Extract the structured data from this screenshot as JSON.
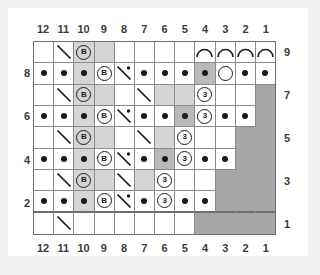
{
  "chart": {
    "type": "knitting-stitch-chart",
    "title": "",
    "columns_count": 12,
    "rows_count": 9,
    "column_labels_top": [
      "12",
      "11",
      "10",
      "9",
      "8",
      "7",
      "6",
      "5",
      "4",
      "3",
      "2",
      "1"
    ],
    "column_labels_bottom": [
      "12",
      "11",
      "10",
      "9",
      "8",
      "7",
      "6",
      "5",
      "4",
      "3",
      "2",
      "1"
    ],
    "row_labels_left": [
      "",
      "8",
      "",
      "6",
      "",
      "4",
      "",
      "2",
      ""
    ],
    "row_labels_right": [
      "9",
      "",
      "7",
      "",
      "5",
      "",
      "3",
      "",
      "1"
    ],
    "row_numbers_top_to_bottom": [
      9,
      8,
      7,
      6,
      5,
      4,
      3,
      2,
      1
    ],
    "colors": {
      "page_background": "#f1f1f1",
      "card_background": "#ffffff",
      "grid_line": "#8a8a8a",
      "grid_border": "#6e6e6e",
      "shade_light": "#d5d5d5",
      "shade_mid": "#b9b9b9",
      "shade_nostitch": "#a6a6a6",
      "symbol_ink": "#1a1a1a",
      "label_text": "#3b3b3b"
    },
    "symbol_legend": {
      "dot": "purl-stitch",
      "b": "bobble",
      "three": "three-stitch-cluster",
      "circle": "yarn-over",
      "arc": "chain-arc",
      "diag": "decrease-diagonal",
      "diagdot": "decrease-diagonal-with-purl"
    },
    "rows": [
      {
        "row": 9,
        "label_right": "9",
        "label_left": "",
        "cells": [
          {
            "col": 12,
            "shade": "none",
            "symbol": "none"
          },
          {
            "col": 11,
            "shade": "none",
            "symbol": "diag"
          },
          {
            "col": 10,
            "shade": "light",
            "symbol": "b"
          },
          {
            "col": 9,
            "shade": "light",
            "symbol": "none"
          },
          {
            "col": 8,
            "shade": "none",
            "symbol": "none"
          },
          {
            "col": 7,
            "shade": "none",
            "symbol": "none"
          },
          {
            "col": 6,
            "shade": "none",
            "symbol": "none"
          },
          {
            "col": 5,
            "shade": "none",
            "symbol": "none"
          },
          {
            "col": 4,
            "shade": "none",
            "symbol": "arc"
          },
          {
            "col": 3,
            "shade": "none",
            "symbol": "arc"
          },
          {
            "col": 2,
            "shade": "none",
            "symbol": "arc"
          },
          {
            "col": 1,
            "shade": "none",
            "symbol": "arc"
          }
        ]
      },
      {
        "row": 8,
        "label_right": "",
        "label_left": "8",
        "cells": [
          {
            "col": 12,
            "shade": "none",
            "symbol": "dot"
          },
          {
            "col": 11,
            "shade": "none",
            "symbol": "dot"
          },
          {
            "col": 10,
            "shade": "light",
            "symbol": "dot"
          },
          {
            "col": 9,
            "shade": "none",
            "symbol": "b"
          },
          {
            "col": 8,
            "shade": "none",
            "symbol": "diagdot"
          },
          {
            "col": 7,
            "shade": "none",
            "symbol": "dot"
          },
          {
            "col": 6,
            "shade": "none",
            "symbol": "dot"
          },
          {
            "col": 5,
            "shade": "none",
            "symbol": "dot"
          },
          {
            "col": 4,
            "shade": "mid",
            "symbol": "dot"
          },
          {
            "col": 3,
            "shade": "none",
            "symbol": "circle"
          },
          {
            "col": 2,
            "shade": "none",
            "symbol": "dot"
          },
          {
            "col": 1,
            "shade": "none",
            "symbol": "dot"
          }
        ]
      },
      {
        "row": 7,
        "label_right": "7",
        "label_left": "",
        "cells": [
          {
            "col": 12,
            "shade": "none",
            "symbol": "none"
          },
          {
            "col": 11,
            "shade": "none",
            "symbol": "diag"
          },
          {
            "col": 10,
            "shade": "light",
            "symbol": "b"
          },
          {
            "col": 9,
            "shade": "light",
            "symbol": "none"
          },
          {
            "col": 8,
            "shade": "none",
            "symbol": "none"
          },
          {
            "col": 7,
            "shade": "none",
            "symbol": "diag"
          },
          {
            "col": 6,
            "shade": "light",
            "symbol": "none"
          },
          {
            "col": 5,
            "shade": "light",
            "symbol": "none"
          },
          {
            "col": 4,
            "shade": "none",
            "symbol": "three"
          },
          {
            "col": 3,
            "shade": "none",
            "symbol": "none"
          },
          {
            "col": 2,
            "shade": "none",
            "symbol": "none"
          },
          {
            "col": 1,
            "shade": "block",
            "symbol": "none"
          }
        ]
      },
      {
        "row": 6,
        "label_right": "",
        "label_left": "6",
        "cells": [
          {
            "col": 12,
            "shade": "none",
            "symbol": "dot"
          },
          {
            "col": 11,
            "shade": "none",
            "symbol": "dot"
          },
          {
            "col": 10,
            "shade": "light",
            "symbol": "dot"
          },
          {
            "col": 9,
            "shade": "none",
            "symbol": "b"
          },
          {
            "col": 8,
            "shade": "none",
            "symbol": "diagdot"
          },
          {
            "col": 7,
            "shade": "none",
            "symbol": "dot"
          },
          {
            "col": 6,
            "shade": "none",
            "symbol": "dot"
          },
          {
            "col": 5,
            "shade": "mid",
            "symbol": "dot"
          },
          {
            "col": 4,
            "shade": "none",
            "symbol": "three"
          },
          {
            "col": 3,
            "shade": "none",
            "symbol": "dot"
          },
          {
            "col": 2,
            "shade": "none",
            "symbol": "dot"
          },
          {
            "col": 1,
            "shade": "block",
            "symbol": "none"
          }
        ]
      },
      {
        "row": 5,
        "label_right": "5",
        "label_left": "",
        "cells": [
          {
            "col": 12,
            "shade": "none",
            "symbol": "none"
          },
          {
            "col": 11,
            "shade": "none",
            "symbol": "diag"
          },
          {
            "col": 10,
            "shade": "light",
            "symbol": "b"
          },
          {
            "col": 9,
            "shade": "light",
            "symbol": "none"
          },
          {
            "col": 8,
            "shade": "none",
            "symbol": "none"
          },
          {
            "col": 7,
            "shade": "none",
            "symbol": "diag"
          },
          {
            "col": 6,
            "shade": "light",
            "symbol": "none"
          },
          {
            "col": 5,
            "shade": "none",
            "symbol": "three"
          },
          {
            "col": 4,
            "shade": "none",
            "symbol": "none"
          },
          {
            "col": 3,
            "shade": "none",
            "symbol": "none"
          },
          {
            "col": 2,
            "shade": "block",
            "symbol": "none"
          },
          {
            "col": 1,
            "shade": "block",
            "symbol": "none"
          }
        ]
      },
      {
        "row": 4,
        "label_right": "",
        "label_left": "4",
        "cells": [
          {
            "col": 12,
            "shade": "none",
            "symbol": "dot"
          },
          {
            "col": 11,
            "shade": "none",
            "symbol": "dot"
          },
          {
            "col": 10,
            "shade": "light",
            "symbol": "dot"
          },
          {
            "col": 9,
            "shade": "none",
            "symbol": "b"
          },
          {
            "col": 8,
            "shade": "none",
            "symbol": "diagdot"
          },
          {
            "col": 7,
            "shade": "none",
            "symbol": "dot"
          },
          {
            "col": 6,
            "shade": "mid",
            "symbol": "dot"
          },
          {
            "col": 5,
            "shade": "none",
            "symbol": "three"
          },
          {
            "col": 4,
            "shade": "none",
            "symbol": "dot"
          },
          {
            "col": 3,
            "shade": "none",
            "symbol": "dot"
          },
          {
            "col": 2,
            "shade": "block",
            "symbol": "none"
          },
          {
            "col": 1,
            "shade": "block",
            "symbol": "none"
          }
        ]
      },
      {
        "row": 3,
        "label_right": "3",
        "label_left": "",
        "cells": [
          {
            "col": 12,
            "shade": "none",
            "symbol": "none"
          },
          {
            "col": 11,
            "shade": "none",
            "symbol": "diag"
          },
          {
            "col": 10,
            "shade": "light",
            "symbol": "b"
          },
          {
            "col": 9,
            "shade": "light",
            "symbol": "none"
          },
          {
            "col": 8,
            "shade": "none",
            "symbol": "diag"
          },
          {
            "col": 7,
            "shade": "light",
            "symbol": "none"
          },
          {
            "col": 6,
            "shade": "none",
            "symbol": "three"
          },
          {
            "col": 5,
            "shade": "none",
            "symbol": "none"
          },
          {
            "col": 4,
            "shade": "none",
            "symbol": "none"
          },
          {
            "col": 3,
            "shade": "block",
            "symbol": "none"
          },
          {
            "col": 2,
            "shade": "block",
            "symbol": "none"
          },
          {
            "col": 1,
            "shade": "block",
            "symbol": "none"
          }
        ]
      },
      {
        "row": 2,
        "label_right": "",
        "label_left": "2",
        "cells": [
          {
            "col": 12,
            "shade": "none",
            "symbol": "dot"
          },
          {
            "col": 11,
            "shade": "none",
            "symbol": "dot"
          },
          {
            "col": 10,
            "shade": "light",
            "symbol": "dot"
          },
          {
            "col": 9,
            "shade": "none",
            "symbol": "b"
          },
          {
            "col": 8,
            "shade": "none",
            "symbol": "diagdot"
          },
          {
            "col": 7,
            "shade": "none",
            "symbol": "dot"
          },
          {
            "col": 6,
            "shade": "none",
            "symbol": "three"
          },
          {
            "col": 5,
            "shade": "none",
            "symbol": "dot"
          },
          {
            "col": 4,
            "shade": "none",
            "symbol": "dot"
          },
          {
            "col": 3,
            "shade": "block",
            "symbol": "none"
          },
          {
            "col": 2,
            "shade": "block",
            "symbol": "none"
          },
          {
            "col": 1,
            "shade": "block",
            "symbol": "none"
          }
        ]
      },
      {
        "row": 1,
        "label_right": "1",
        "label_left": "",
        "cells": [
          {
            "col": 12,
            "shade": "none",
            "symbol": "none"
          },
          {
            "col": 11,
            "shade": "none",
            "symbol": "diag"
          },
          {
            "col": 10,
            "shade": "none",
            "symbol": "none"
          },
          {
            "col": 9,
            "shade": "none",
            "symbol": "none"
          },
          {
            "col": 8,
            "shade": "none",
            "symbol": "none"
          },
          {
            "col": 7,
            "shade": "none",
            "symbol": "none"
          },
          {
            "col": 6,
            "shade": "none",
            "symbol": "none"
          },
          {
            "col": 5,
            "shade": "none",
            "symbol": "none"
          },
          {
            "col": 4,
            "shade": "block",
            "symbol": "none"
          },
          {
            "col": 3,
            "shade": "block",
            "symbol": "none"
          },
          {
            "col": 2,
            "shade": "block",
            "symbol": "none"
          },
          {
            "col": 1,
            "shade": "block",
            "symbol": "none"
          }
        ]
      }
    ],
    "symbol_text": {
      "b": "B",
      "three": "3"
    }
  }
}
